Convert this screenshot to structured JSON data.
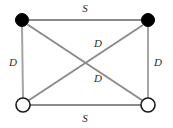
{
  "diagram": {
    "canvas": {
      "width": 173,
      "height": 128,
      "background": "#ffffff"
    },
    "style": {
      "edge_color": "#8a8a8a",
      "edge_color_light": "#a5a5a5",
      "node_fill_filled": "#000000",
      "node_fill_open": "#ffffff",
      "node_stroke": "#1a1a1a",
      "label_color": "#2b2b2b"
    },
    "nodes": [
      {
        "id": "top-left",
        "label": "",
        "type": "filled",
        "cx": 22,
        "cy": 20,
        "r": 6.5
      },
      {
        "id": "top-right",
        "label": "",
        "type": "filled",
        "cx": 148,
        "cy": 20,
        "r": 6.5
      },
      {
        "id": "bottom-left",
        "label": "",
        "type": "open",
        "cx": 23,
        "cy": 105,
        "r": 7
      },
      {
        "id": "bottom-right",
        "label": "",
        "type": "open",
        "cx": 148,
        "cy": 105,
        "r": 7
      }
    ],
    "edges": [
      {
        "id": "edge-top",
        "from": "top-left",
        "to": "top-right",
        "label": "S",
        "label_x": 85,
        "label_y": 8
      },
      {
        "id": "edge-bottom",
        "from": "bottom-left",
        "to": "bottom-right",
        "label": "S",
        "label_x": 85,
        "label_y": 118
      },
      {
        "id": "edge-left",
        "from": "top-left",
        "to": "bottom-left",
        "label": "D",
        "label_x": 13,
        "label_y": 62
      },
      {
        "id": "edge-right",
        "from": "top-right",
        "to": "bottom-right",
        "label": "D",
        "label_x": 158,
        "label_y": 62
      },
      {
        "id": "edge-diagonal-upper",
        "from": "top-left",
        "to": "bottom-right",
        "label": "D",
        "label_x": 98,
        "label_y": 43
      },
      {
        "id": "edge-diagonal-lower",
        "from": "bottom-left",
        "to": "top-right",
        "label": "D",
        "label_x": 98,
        "label_y": 78
      }
    ]
  }
}
